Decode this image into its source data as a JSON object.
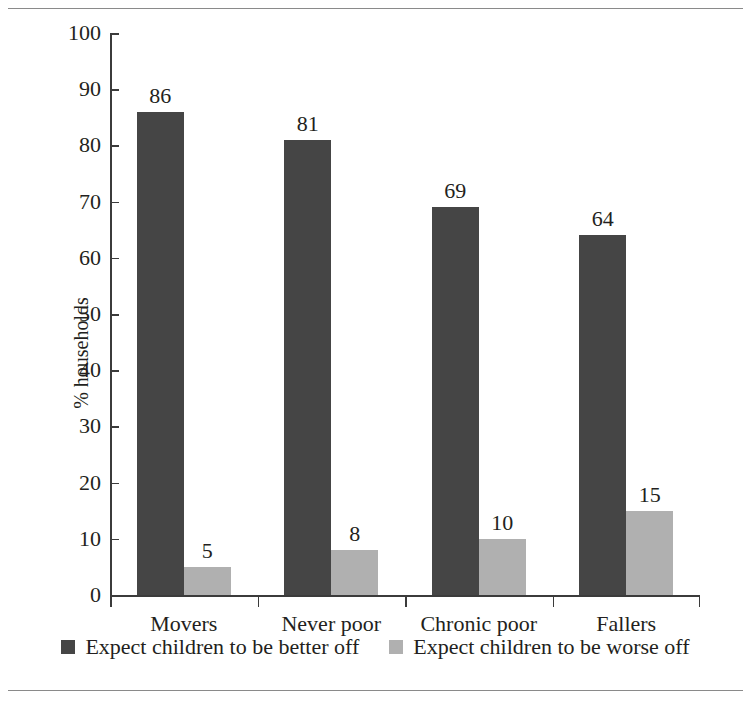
{
  "chart_data": {
    "type": "bar",
    "title": "",
    "subtitle": "",
    "xlabel": "",
    "ylabel": "% households",
    "ylim": [
      0,
      100
    ],
    "ytick_step": 10,
    "yticks": [
      0,
      10,
      20,
      30,
      40,
      50,
      60,
      70,
      80,
      90,
      100
    ],
    "grid": false,
    "legend_position": "bottom-center",
    "categories": [
      "Movers",
      "Never poor",
      "Chronic poor",
      "Fallers"
    ],
    "series": [
      {
        "name": "Expect children to be better off",
        "color": "#454545",
        "values": [
          86,
          81,
          69,
          64
        ]
      },
      {
        "name": "Expect children to be worse off",
        "color": "#b0b0b0",
        "values": [
          5,
          8,
          10,
          15
        ]
      }
    ],
    "annotations": {
      "value_labels_shown": true
    }
  },
  "legend": {
    "items": [
      {
        "label": "Expect children to be better off",
        "swatch": "dark-swatch-icon"
      },
      {
        "label": "Expect children to be worse off",
        "swatch": "light-swatch-icon"
      }
    ]
  },
  "colors": {
    "series_dark": "#454545",
    "series_light": "#b0b0b0",
    "axis": "#3b3b3b",
    "text": "#231f20",
    "rule": "#8a8a8a",
    "background": "#ffffff"
  }
}
